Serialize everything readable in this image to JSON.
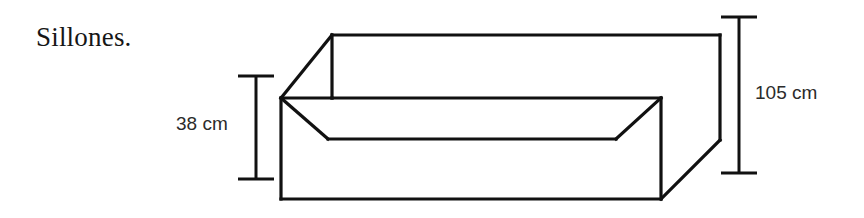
{
  "figure": {
    "title": "Sillones.",
    "background_color": "#ffffff",
    "line_color": "#111111",
    "text_color": "#2b2b2b"
  },
  "dimensions": [
    {
      "id": "seat-height",
      "label": "38 cm",
      "value": 38,
      "unit": "cm",
      "position": "left",
      "measures": "seat-height"
    },
    {
      "id": "depth",
      "label": "105 cm",
      "value": 105,
      "unit": "cm",
      "position": "right",
      "measures": "overall-depth"
    }
  ]
}
